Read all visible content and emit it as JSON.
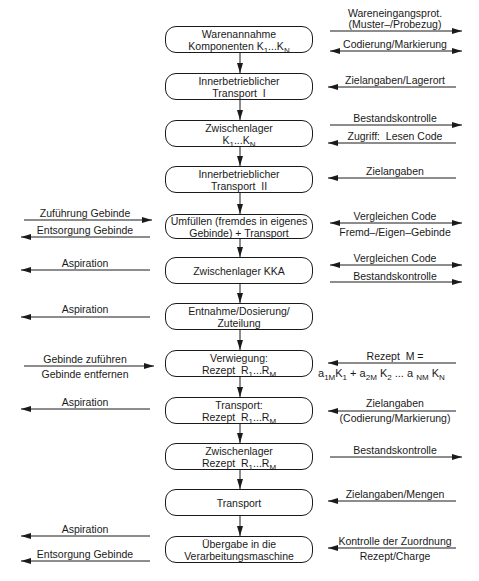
{
  "diagram": {
    "type": "process-flow",
    "steps": [
      {
        "line1": "Warenannahme",
        "line2": "Komponenten K₁...K_N"
      },
      {
        "line1": "Innerbetrieblicher",
        "line2": "Transport  I"
      },
      {
        "line1": "Zwischenlager",
        "line2": "K₁...K_N"
      },
      {
        "line1": "Innerbetrieblicher",
        "line2": "Transport  II"
      },
      {
        "line1": "Umfüllen (fremdes in eigenes",
        "line2": "Gebinde) + Transport"
      },
      {
        "line1": "Zwischenlager KKA",
        "line2": ""
      },
      {
        "line1": "Entnahme/Dosierung/",
        "line2": "Zuteilung"
      },
      {
        "line1": "Verwiegung:",
        "line2": "Rezept  R₁...R_M"
      },
      {
        "line1": "Transport:",
        "line2": "Rezept  R₁...R_M"
      },
      {
        "line1": "Zwischenlager",
        "line2": "Rezept  R₁...R_M"
      },
      {
        "line1": "Transport",
        "line2": ""
      },
      {
        "line1": "Übergabe in die",
        "line2": "Verarbeitungsmaschine"
      }
    ],
    "right_labels": {
      "r1a": "Wareneingangsprot.",
      "r1b": "(Muster–/Probezug)",
      "r1c": "Codierung/Markierung",
      "r2": "Zielangaben/Lagerort",
      "r3a": "Bestandskontrolle",
      "r3b": "Zugriff:  Lesen Code",
      "r4": "Zielangaben",
      "r5a": "Vergleichen Code",
      "r5b": "Fremd–/Eigen–Gebinde",
      "r6a": "Vergleichen Code",
      "r6b": "Bestandskontrolle",
      "r8a": "Rezept  M =",
      "r8b": "a₁ₘK₁ + a₂ₘK₂ ... a_NM K_N",
      "r9a": "Zielangaben",
      "r9b": "(Codierung/Markierung)",
      "r10": "Bestandskontrolle",
      "r11": "Zielangaben/Mengen",
      "r12a": "Kontrolle der Zuordnung",
      "r12b": "Rezept/Charge"
    },
    "left_labels": {
      "l5a": "Zuführung Gebinde",
      "l5b": "Entsorgung Gebinde",
      "l6": "Aspiration",
      "l7": "Aspiration",
      "l8a": "Gebinde zuführen",
      "l8b": "Gebinde entfernen",
      "l9": "Aspiration",
      "l12a": "Aspiration",
      "l12b": "Entsorgung Gebinde"
    }
  }
}
